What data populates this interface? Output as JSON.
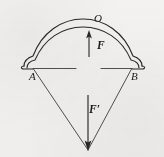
{
  "figure": {
    "background_color": "#f3f2f0",
    "stroke_color": "#2a2725",
    "labels": {
      "apex": "O",
      "left_tip": "A",
      "right_tip": "B",
      "force_up": "F",
      "force_down": "F′"
    },
    "geometry": {
      "left_tip_x": 33,
      "left_tip_y": 68,
      "right_tip_x": 132,
      "right_tip_y": 68,
      "apex_x": 83,
      "apex_y": 22,
      "vertex_x": 88,
      "vertex_y": 150,
      "string_y": 68
    },
    "vectors": [
      {
        "name": "F",
        "label": "F",
        "direction": "up",
        "tail_x": 89,
        "tail_y": 56,
        "head_x": 89,
        "head_y": 33
      },
      {
        "name": "F-prime",
        "label": "F′",
        "direction": "down",
        "tail_x": 88,
        "tail_y": 95,
        "head_x": 88,
        "head_y": 150
      }
    ]
  }
}
